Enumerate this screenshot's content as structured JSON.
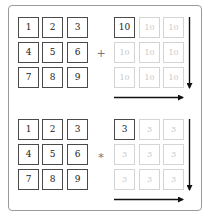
{
  "diagram": {
    "title": "",
    "panels": [
      {
        "name": "addition",
        "operator": "+",
        "left_matrix": [
          [
            "1",
            "2",
            "3"
          ],
          [
            "4",
            "5",
            "6"
          ],
          [
            "7",
            "8",
            "9"
          ]
        ],
        "right_scalar": "10",
        "right_broadcast": [
          [
            "10",
            "10",
            "10"
          ],
          [
            "10",
            "10",
            "10"
          ],
          [
            "10",
            "10",
            "10"
          ]
        ],
        "arrows": [
          "down",
          "right"
        ]
      },
      {
        "name": "multiplication",
        "operator": "*",
        "left_matrix": [
          [
            "1",
            "2",
            "3"
          ],
          [
            "4",
            "5",
            "6"
          ],
          [
            "7",
            "8",
            "9"
          ]
        ],
        "right_scalar": "3",
        "right_broadcast": [
          [
            "3",
            "3",
            "3"
          ],
          [
            "3",
            "3",
            "3"
          ],
          [
            "3",
            "3",
            "3"
          ]
        ],
        "arrows": [
          "down",
          "right"
        ]
      }
    ],
    "colors": {
      "solid_border": "#4a4a4a",
      "faded_border": "#d4d4d4",
      "faded_text": "#c8c8c8",
      "arrow": "#111111",
      "frame": "#9a9a9a"
    }
  }
}
